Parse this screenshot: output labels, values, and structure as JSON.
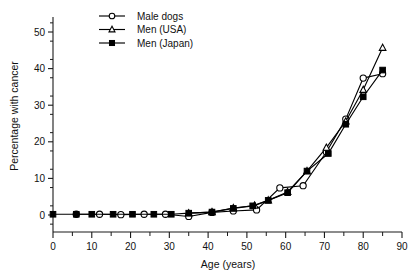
{
  "chart_data": {
    "type": "line",
    "title": "",
    "xlabel": "Age (years)",
    "ylabel": "Percentage with cancer",
    "xlim": [
      0,
      90
    ],
    "ylim": [
      -2,
      55
    ],
    "xticks": [
      0,
      10,
      20,
      30,
      40,
      50,
      60,
      70,
      80,
      90
    ],
    "xtick_labels": [
      "0",
      "10",
      "20",
      "30",
      "40",
      "50",
      "60",
      "70",
      "80",
      "90"
    ],
    "xminor_step": 5,
    "yticks": [
      0,
      10,
      20,
      30,
      40,
      50
    ],
    "ytick_labels": [
      "0",
      "10",
      "20",
      "30",
      "40",
      "50"
    ],
    "yminor_step": 5,
    "grid": false,
    "legend_position": "top-left-inside",
    "series": [
      {
        "name": "Male dogs",
        "marker": "open-circle",
        "x": [
          6.0,
          12.0,
          17.5,
          23.5,
          29.0,
          35.0,
          41.0,
          46.5,
          52.5,
          58.5,
          64.5,
          70.5,
          75.5,
          80.0,
          85.0
        ],
        "y": [
          0.2,
          0.2,
          0.1,
          0.2,
          0.2,
          -0.4,
          0.7,
          1.1,
          1.4,
          7.4,
          8.0,
          17.2,
          26.2,
          37.4,
          38.6
        ]
      },
      {
        "name": "Men (USA)",
        "marker": "open-triangle",
        "x": [
          35.0,
          41.0,
          46.5,
          52.0,
          55.5,
          60.5,
          65.5,
          70.5,
          75.5,
          80.0,
          85.0
        ],
        "y": [
          0.5,
          0.8,
          1.9,
          2.6,
          4.0,
          6.3,
          12.0,
          18.4,
          25.6,
          34.2,
          45.7
        ]
      },
      {
        "name": "Men (Japan)",
        "marker": "filled-square",
        "x": [
          0.0,
          6.0,
          10.0,
          15.5,
          20.5,
          26.0,
          30.5,
          35.0,
          41.0,
          46.5,
          51.5,
          55.5,
          60.5,
          65.5,
          71.0,
          75.5,
          80.0,
          85.0
        ],
        "y": [
          0.2,
          0.2,
          0.2,
          0.2,
          0.2,
          0.2,
          0.2,
          0.5,
          0.8,
          1.8,
          2.5,
          4.0,
          6.1,
          12.0,
          16.8,
          24.8,
          32.3,
          39.6
        ]
      }
    ],
    "legend": [
      {
        "label": "Male dogs",
        "marker": "open-circle"
      },
      {
        "label": "Men (USA)",
        "marker": "open-triangle"
      },
      {
        "label": "Men (Japan)",
        "marker": "filled-square"
      }
    ],
    "colors": {
      "ink": "#000000",
      "background": "#ffffff"
    }
  }
}
